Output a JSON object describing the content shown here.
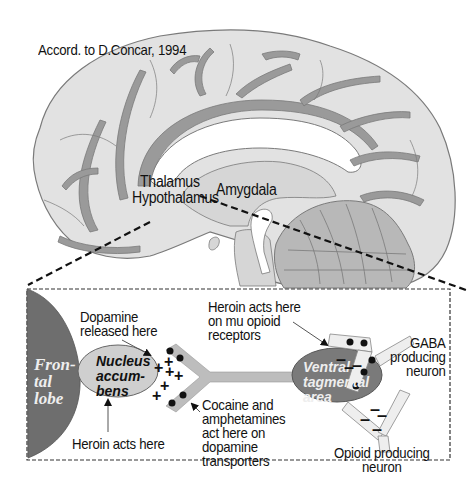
{
  "figure": {
    "credit": "Accord. to D.Concar, 1994",
    "colors": {
      "brain_fill": "#e2e2e2",
      "brain_outline": "#7a7a7a",
      "vessel_fill": "#9a9a9a",
      "cerebellum_fill": "#b8b8b8",
      "frontal_lobe_fill": "#6e6e6e",
      "nucleus_accumbens_fill": "#cfcfcf",
      "vta_fill": "#7a7a7a",
      "axon_fill": "#bdbdbd",
      "dashed_line": "#111111"
    },
    "brain_labels": {
      "thalamus": "Thalamus",
      "hypothalamus": "Hypothalamus",
      "amygdala": "Amygdala"
    },
    "inset": {
      "frontal_lobe": "Fron-\ntal\nlobe",
      "nucleus_accumbens": "Nucleus\naccum-\nbens",
      "ventral_tegmental_area": "Ventral\ntagmental\narea",
      "dopamine_released": "Dopamine\nreleased here",
      "heroin_acts_here": "Heroin acts here",
      "heroin_mu": "Heroin acts here\non mu opioid\nreceptors",
      "cocaine": "Cocaine and\namphetamines\nact here on\ndopamine\ntransporters",
      "gaba_neuron": "GABA\nproducing\nneuron",
      "opioid_neuron": "Opioid producing\nneuron",
      "plus_symbol": "+",
      "minus_symbol": "–"
    }
  }
}
